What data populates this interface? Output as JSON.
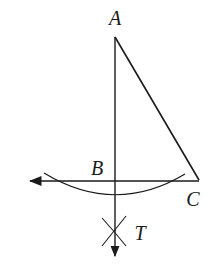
{
  "diagram": {
    "type": "geometric-construction",
    "colors": {
      "stroke": "#1a1a1a",
      "background": "#ffffff"
    },
    "points": [
      {
        "id": "A",
        "label": "A",
        "x": 115,
        "y": 37,
        "label_x": 115,
        "label_y": 25
      },
      {
        "id": "B",
        "label": "B",
        "x": 115,
        "y": 181,
        "label_x": 97,
        "label_y": 170
      },
      {
        "id": "C",
        "label": "C",
        "x": 199,
        "y": 180,
        "label_x": 193,
        "label_y": 203
      },
      {
        "id": "T",
        "label": "T",
        "x": 114,
        "y": 231,
        "label_x": 139,
        "label_y": 238
      }
    ],
    "segments": [
      {
        "from": "A",
        "to": "C"
      },
      {
        "from": "A",
        "to": "B",
        "extends": "ray downward through T with arrowhead"
      },
      {
        "from": "C",
        "to": "B",
        "extends": "ray leftward with arrowhead"
      }
    ],
    "arc": {
      "start": [
        44,
        173
      ],
      "mid": [
        115,
        196
      ],
      "end": [
        185,
        174
      ],
      "description": "arc centered at C intersecting line BC"
    },
    "cross_mark": {
      "at": "T",
      "description": "intersecting arcs marking point T"
    }
  }
}
